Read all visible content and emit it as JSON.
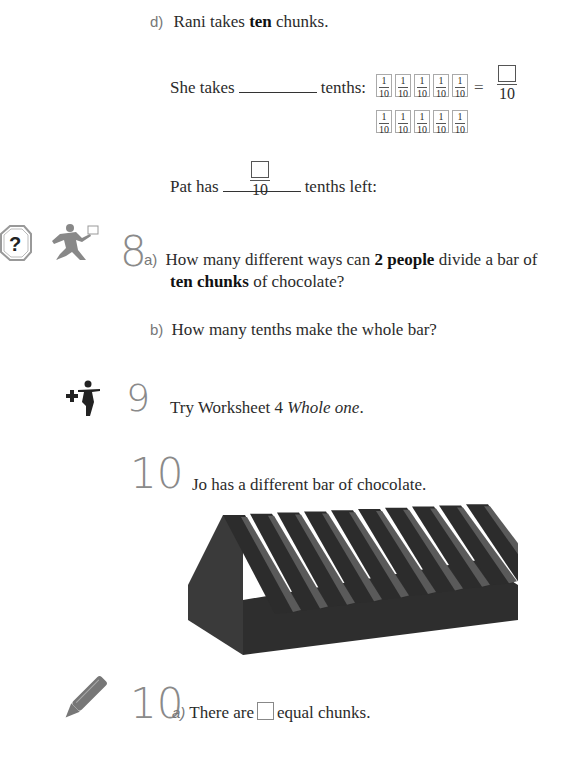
{
  "part_d": {
    "label": "d)",
    "line1_pre": "Rani takes ",
    "line1_bold": "ten",
    "line1_post": " chunks.",
    "line2_pre": "She takes",
    "line2_post": "tenths:",
    "tile_num": "1",
    "tile_den": "10",
    "tiles_row1_count": 5,
    "tiles_row2_count": 5,
    "equals": "=",
    "result_den": "10",
    "line3_pre": "Pat has",
    "line3_post": "tenths left:",
    "left_den": "10"
  },
  "q8": {
    "number": "8",
    "a_label": "a)",
    "a_pre": "How many different ways can ",
    "a_bold1": "2 people",
    "a_mid": " divide a bar of",
    "a_bold2": "ten chunks",
    "a_post": " of chocolate?",
    "b_label": "b)",
    "b_text": "How many tenths make the whole bar?",
    "icons": [
      "question-stop-sign-icon",
      "running-person-icon"
    ]
  },
  "q9": {
    "number": "9",
    "text_pre": "Try Worksheet 4 ",
    "text_italic": "Whole one",
    "text_post": ".",
    "icons": [
      "extension-plus-figure-icon"
    ]
  },
  "q10": {
    "number": "10",
    "text": "Jo has a different bar of chocolate.",
    "image": "chocolate-bar-illustration",
    "bar_chunks": 10
  },
  "q10a": {
    "number": "10",
    "label": "a)",
    "text_pre": "There are",
    "text_post": "equal chunks.",
    "icons": [
      "pencil-icon"
    ]
  }
}
